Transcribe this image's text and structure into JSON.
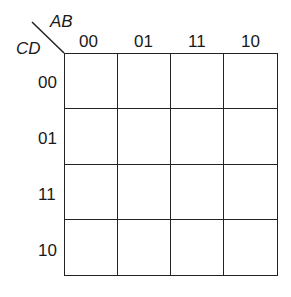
{
  "kmap": {
    "row_variable": "CD",
    "col_variable": "AB",
    "col_labels": [
      "00",
      "01",
      "11",
      "10"
    ],
    "row_labels": [
      "00",
      "01",
      "11",
      "10"
    ],
    "cells": [
      [
        "",
        "",
        "",
        ""
      ],
      [
        "",
        "",
        "",
        ""
      ],
      [
        "",
        "",
        "",
        ""
      ],
      [
        "",
        "",
        "",
        ""
      ]
    ]
  }
}
